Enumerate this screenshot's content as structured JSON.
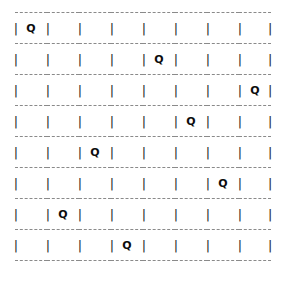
{
  "diagram": {
    "kind": "ascii-chessboard",
    "rows": 8,
    "columns": 8,
    "queen_glyph": "Q",
    "empty_glyph": "",
    "pipe_glyph": "|",
    "colors": {
      "background": "#ffffff",
      "grid_line": "#8a8a8a",
      "pipe": "#2b2b2b",
      "queen_text": "#0d0d0d"
    },
    "queen_columns": [
      1,
      5,
      8,
      6,
      3,
      7,
      2,
      4
    ],
    "board": [
      [
        "Q",
        "",
        "",
        "",
        "",
        "",
        "",
        ""
      ],
      [
        "",
        "",
        "",
        "",
        "Q",
        "",
        "",
        ""
      ],
      [
        "",
        "",
        "",
        "",
        "",
        "",
        "",
        "Q"
      ],
      [
        "",
        "",
        "",
        "",
        "",
        "Q",
        "",
        ""
      ],
      [
        "",
        "",
        "Q",
        "",
        "",
        "",
        "",
        ""
      ],
      [
        "",
        "",
        "",
        "",
        "",
        "",
        "Q",
        ""
      ],
      [
        "",
        "Q",
        "",
        "",
        "",
        "",
        "",
        ""
      ],
      [
        "",
        "",
        "",
        "Q",
        "",
        "",
        "",
        ""
      ]
    ]
  }
}
